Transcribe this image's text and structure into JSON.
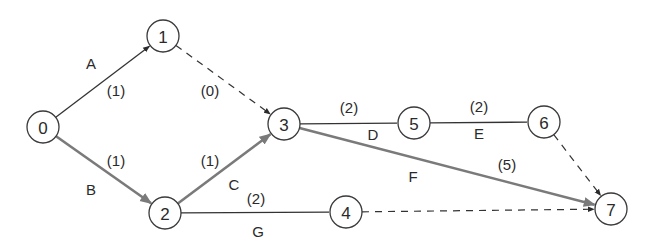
{
  "diagram": {
    "type": "activity-on-arrow network",
    "colors": {
      "normal_edge": "#333333",
      "critical_edge": "#7a7a7a",
      "dummy_edge": "#333333",
      "node_stroke": "#3a3a3a",
      "text": "#2a2a2a"
    },
    "nodes": [
      {
        "id": "0",
        "label": "0",
        "x": 43,
        "y": 127
      },
      {
        "id": "1",
        "label": "1",
        "x": 163,
        "y": 36
      },
      {
        "id": "2",
        "label": "2",
        "x": 165,
        "y": 213
      },
      {
        "id": "3",
        "label": "3",
        "x": 284,
        "y": 124
      },
      {
        "id": "4",
        "label": "4",
        "x": 346,
        "y": 212
      },
      {
        "id": "5",
        "label": "5",
        "x": 414,
        "y": 123
      },
      {
        "id": "6",
        "label": "6",
        "x": 544,
        "y": 122
      },
      {
        "id": "7",
        "label": "7",
        "x": 611,
        "y": 209
      }
    ],
    "edges": [
      {
        "from": "0",
        "to": "1",
        "activity": "A",
        "duration": "(1)",
        "style": "normal",
        "arrow": true,
        "activity_pos": [
          91,
          63
        ],
        "duration_pos": [
          116,
          90
        ]
      },
      {
        "from": "0",
        "to": "2",
        "activity": "B",
        "duration": "(1)",
        "style": "critical",
        "arrow": true,
        "activity_pos": [
          91,
          189
        ],
        "duration_pos": [
          116,
          160
        ]
      },
      {
        "from": "1",
        "to": "3",
        "activity": "",
        "duration": "(0)",
        "style": "dummy",
        "arrow": true,
        "activity_pos": null,
        "duration_pos": [
          210,
          90
        ]
      },
      {
        "from": "2",
        "to": "3",
        "activity": "C",
        "duration": "(1)",
        "style": "critical",
        "arrow": true,
        "activity_pos": [
          234,
          184
        ],
        "duration_pos": [
          210,
          160
        ]
      },
      {
        "from": "2",
        "to": "4",
        "activity": "G",
        "duration": "(2)",
        "style": "normal",
        "arrow": false,
        "activity_pos": [
          258,
          231
        ],
        "duration_pos": [
          256,
          198
        ]
      },
      {
        "from": "3",
        "to": "5",
        "activity": "D",
        "duration": "(2)",
        "style": "normal",
        "arrow": false,
        "activity_pos": [
          373,
          134
        ],
        "duration_pos": [
          349,
          107
        ]
      },
      {
        "from": "5",
        "to": "6",
        "activity": "E",
        "duration": "(2)",
        "style": "normal",
        "arrow": false,
        "activity_pos": [
          479,
          133
        ],
        "duration_pos": [
          479,
          106
        ]
      },
      {
        "from": "3",
        "to": "7",
        "activity": "F",
        "duration": "(5)",
        "style": "critical",
        "arrow": true,
        "activity_pos": [
          413,
          176
        ],
        "duration_pos": [
          507,
          164
        ]
      },
      {
        "from": "4",
        "to": "7",
        "activity": "",
        "duration": "",
        "style": "dummy",
        "arrow": true,
        "activity_pos": null,
        "duration_pos": null
      },
      {
        "from": "6",
        "to": "7",
        "activity": "",
        "duration": "",
        "style": "dummy",
        "arrow": true,
        "activity_pos": null,
        "duration_pos": null
      }
    ],
    "node_radius": 16
  }
}
